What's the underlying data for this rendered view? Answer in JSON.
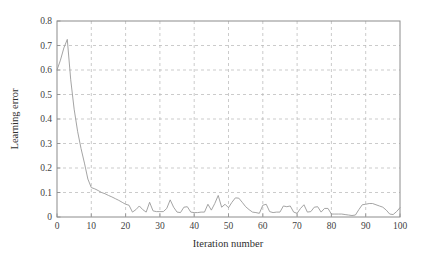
{
  "chart_data": {
    "type": "line",
    "title": "",
    "xlabel": "Iteration number",
    "ylabel": "Learning error",
    "xlim": [
      0,
      100
    ],
    "ylim": [
      0,
      0.8
    ],
    "grid": true,
    "legend": null,
    "xticks": [
      "0",
      "10",
      "20",
      "30",
      "40",
      "50",
      "60",
      "70",
      "80",
      "90",
      "100"
    ],
    "xtick_values": [
      0,
      10,
      20,
      30,
      40,
      50,
      60,
      70,
      80,
      90,
      100
    ],
    "yticks": [
      "0",
      "0.1",
      "0.2",
      "0.3",
      "0.4",
      "0.5",
      "0.6",
      "0.7",
      "0.8"
    ],
    "ytick_values": [
      0,
      0.1,
      0.2,
      0.3,
      0.4,
      0.5,
      0.6,
      0.7,
      0.8
    ],
    "series": [
      {
        "name": "Learning error",
        "color": "#9a9a9a",
        "x": [
          0,
          1,
          2,
          3,
          4,
          5,
          6,
          7,
          8,
          9,
          10,
          11,
          12,
          13,
          14,
          15,
          16,
          17,
          18,
          19,
          20,
          21,
          22,
          23,
          24,
          25,
          26,
          27,
          28,
          29,
          30,
          31,
          32,
          33,
          34,
          35,
          36,
          37,
          38,
          39,
          40,
          41,
          42,
          43,
          44,
          45,
          46,
          47,
          48,
          49,
          50,
          51,
          52,
          53,
          54,
          55,
          56,
          57,
          58,
          59,
          60,
          61,
          62,
          63,
          64,
          65,
          66,
          67,
          68,
          69,
          70,
          71,
          72,
          73,
          74,
          75,
          76,
          77,
          78,
          79,
          80,
          81,
          82,
          83,
          84,
          85,
          86,
          87,
          88,
          89,
          90,
          91,
          92,
          93,
          94,
          95,
          96,
          97,
          98,
          99,
          100
        ],
        "y": [
          0.6,
          0.64,
          0.69,
          0.725,
          0.56,
          0.44,
          0.35,
          0.28,
          0.22,
          0.155,
          0.12,
          0.115,
          0.108,
          0.1,
          0.095,
          0.088,
          0.082,
          0.075,
          0.068,
          0.06,
          0.052,
          0.048,
          0.02,
          0.03,
          0.045,
          0.03,
          0.02,
          0.06,
          0.025,
          0.022,
          0.022,
          0.022,
          0.035,
          0.07,
          0.04,
          0.02,
          0.018,
          0.04,
          0.042,
          0.02,
          0.018,
          0.018,
          0.02,
          0.02,
          0.052,
          0.028,
          0.055,
          0.088,
          0.04,
          0.052,
          0.038,
          0.06,
          0.078,
          0.077,
          0.06,
          0.042,
          0.03,
          0.02,
          0.018,
          0.015,
          0.048,
          0.052,
          0.022,
          0.018,
          0.02,
          0.02,
          0.045,
          0.042,
          0.045,
          0.02,
          0.015,
          0.035,
          0.05,
          0.02,
          0.022,
          0.04,
          0.042,
          0.02,
          0.035,
          0.035,
          0.012,
          0.012,
          0.012,
          0.012,
          0.01,
          0.008,
          0.006,
          0.008,
          0.03,
          0.05,
          0.052,
          0.055,
          0.055,
          0.05,
          0.045,
          0.04,
          0.028,
          0.012,
          0.01,
          0.022,
          0.038
        ]
      }
    ]
  },
  "axes": {
    "frame_color": "#8c8c8c",
    "grid_color": "#b5b5b5"
  }
}
